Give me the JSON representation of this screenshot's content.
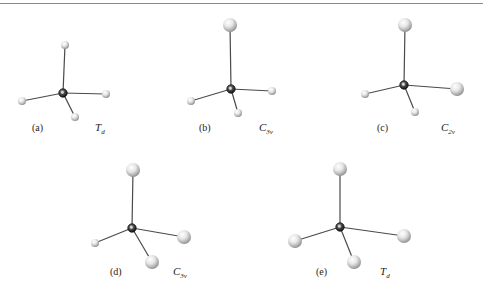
{
  "figure": {
    "type": "molecular-geometry-series",
    "colors": {
      "bond": "#4a4a4a",
      "central_atom": "#2a2a2a",
      "ligand_highlight": "#ffffff",
      "ligand_shade": "#b8b8b8",
      "rule": "#8a8a8a"
    },
    "panels": [
      {
        "id": "a",
        "label": "(a)",
        "point_group": {
          "main": "T",
          "sub": "d"
        },
        "center": [
          63,
          93
        ],
        "ligands": [
          {
            "pos": [
              65,
              45
            ],
            "size": "small"
          },
          {
            "pos": [
              22,
              101
            ],
            "size": "small"
          },
          {
            "pos": [
              106,
              94
            ],
            "size": "small"
          },
          {
            "pos": [
              75,
              117
            ],
            "size": "small"
          }
        ],
        "label_pos": [
          32,
          131
        ],
        "sym_pos": [
          95,
          131
        ]
      },
      {
        "id": "b",
        "label": "(b)",
        "point_group": {
          "main": "C",
          "sub": "3v"
        },
        "center": [
          231,
          89
        ],
        "ligands": [
          {
            "pos": [
              230,
              25
            ],
            "size": "large"
          },
          {
            "pos": [
              191,
              101
            ],
            "size": "small"
          },
          {
            "pos": [
              272,
              91
            ],
            "size": "small"
          },
          {
            "pos": [
              238,
              113
            ],
            "size": "small"
          }
        ],
        "label_pos": [
          199,
          131
        ],
        "sym_pos": [
          259,
          131
        ]
      },
      {
        "id": "c",
        "label": "(c)",
        "point_group": {
          "main": "C",
          "sub": "2v"
        },
        "center": [
          404,
          85
        ],
        "ligands": [
          {
            "pos": [
              405,
              25
            ],
            "size": "large"
          },
          {
            "pos": [
              365,
              94
            ],
            "size": "small"
          },
          {
            "pos": [
              457,
              89
            ],
            "size": "large"
          },
          {
            "pos": [
              415,
              112
            ],
            "size": "small"
          }
        ],
        "label_pos": [
          377,
          131
        ],
        "sym_pos": [
          441,
          131
        ]
      },
      {
        "id": "d",
        "label": "(d)",
        "point_group": {
          "main": "C",
          "sub": "3v"
        },
        "center": [
          132,
          228
        ],
        "ligands": [
          {
            "pos": [
              133,
              170
            ],
            "size": "large"
          },
          {
            "pos": [
              95,
              243
            ],
            "size": "small"
          },
          {
            "pos": [
              184,
              237
            ],
            "size": "large"
          },
          {
            "pos": [
              152,
              262
            ],
            "size": "large"
          }
        ],
        "label_pos": [
          110,
          275
        ],
        "sym_pos": [
          173,
          275
        ]
      },
      {
        "id": "e",
        "label": "(e)",
        "point_group": {
          "main": "T",
          "sub": "d"
        },
        "center": [
          340,
          227
        ],
        "ligands": [
          {
            "pos": [
              340,
              169
            ],
            "size": "large"
          },
          {
            "pos": [
              295,
              241
            ],
            "size": "large"
          },
          {
            "pos": [
              404,
              236
            ],
            "size": "large"
          },
          {
            "pos": [
              354,
              262
            ],
            "size": "large"
          }
        ],
        "label_pos": [
          316,
          275
        ],
        "sym_pos": [
          380,
          275
        ]
      }
    ]
  }
}
